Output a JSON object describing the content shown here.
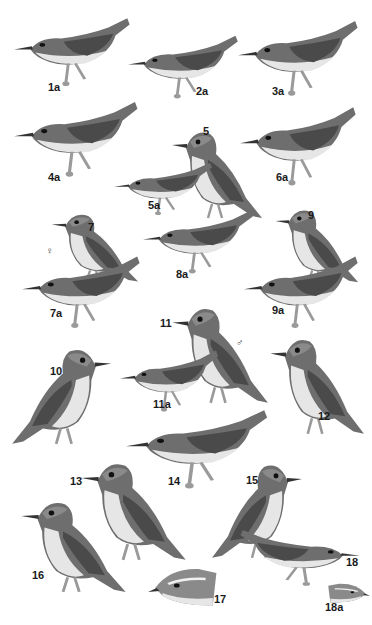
{
  "plate": {
    "background": "#ffffff",
    "colors": {
      "back": "#6e6e6e",
      "wing": "#4a4a4a",
      "belly": "#e6e6e6",
      "head": "#8a8a8a",
      "leg": "#9a9a9a",
      "label": "#1a1a1a"
    },
    "birds": [
      {
        "label": "1a",
        "x": 14,
        "y": 12,
        "w": 118,
        "h": 78,
        "facing": "left",
        "pose": "horizontal",
        "lx": 48,
        "ly": 82
      },
      {
        "label": "2a",
        "x": 128,
        "y": 30,
        "w": 112,
        "h": 72,
        "facing": "left",
        "pose": "horizontal",
        "lx": 196,
        "ly": 86
      },
      {
        "label": "3a",
        "x": 238,
        "y": 14,
        "w": 122,
        "h": 86,
        "facing": "left",
        "pose": "horizontal",
        "lx": 272,
        "ly": 86
      },
      {
        "label": "4a",
        "x": 14,
        "y": 95,
        "w": 126,
        "h": 86,
        "facing": "left",
        "pose": "horizontal",
        "lx": 48,
        "ly": 172
      },
      {
        "label": "5",
        "x": 164,
        "y": 120,
        "w": 100,
        "h": 100,
        "facing": "left",
        "pose": "upright",
        "lx": 203,
        "ly": 126
      },
      {
        "label": "5a",
        "x": 114,
        "y": 158,
        "w": 100,
        "h": 60,
        "facing": "left",
        "pose": "horizontal",
        "lx": 148,
        "ly": 200
      },
      {
        "label": "6a",
        "x": 240,
        "y": 100,
        "w": 118,
        "h": 90,
        "facing": "left",
        "pose": "horizontal",
        "lx": 276,
        "ly": 172
      },
      {
        "label": "7",
        "x": 44,
        "y": 205,
        "w": 96,
        "h": 78,
        "facing": "left",
        "pose": "upright",
        "lx": 88,
        "ly": 222
      },
      {
        "label": "7a",
        "x": 22,
        "y": 250,
        "w": 120,
        "h": 82,
        "facing": "left",
        "pose": "horizontal",
        "lx": 50,
        "ly": 308
      },
      {
        "label": "8a",
        "x": 143,
        "y": 205,
        "w": 112,
        "h": 72,
        "facing": "left",
        "pose": "horizontal",
        "lx": 176,
        "ly": 269
      },
      {
        "label": "9",
        "x": 268,
        "y": 200,
        "w": 92,
        "h": 84,
        "facing": "left",
        "pose": "upright",
        "lx": 308,
        "ly": 210
      },
      {
        "label": "9a",
        "x": 244,
        "y": 250,
        "w": 116,
        "h": 82,
        "facing": "left",
        "pose": "horizontal",
        "lx": 272,
        "ly": 305
      },
      {
        "label": "11",
        "x": 164,
        "y": 295,
        "w": 106,
        "h": 110,
        "facing": "left",
        "pose": "upright",
        "lx": 160,
        "ly": 318
      },
      {
        "label": "11a",
        "x": 120,
        "y": 345,
        "w": 100,
        "h": 70,
        "facing": "left",
        "pose": "horizontal",
        "lx": 153,
        "ly": 399
      },
      {
        "label": "10",
        "x": 10,
        "y": 336,
        "w": 110,
        "h": 110,
        "facing": "right",
        "pose": "upright",
        "lx": 50,
        "ly": 366
      },
      {
        "label": "12",
        "x": 262,
        "y": 326,
        "w": 104,
        "h": 110,
        "facing": "left",
        "pose": "upright",
        "lx": 318,
        "ly": 411
      },
      {
        "label": "14",
        "x": 126,
        "y": 403,
        "w": 144,
        "h": 90,
        "facing": "left",
        "pose": "horizontal",
        "lx": 168,
        "ly": 476
      },
      {
        "label": "13",
        "x": 72,
        "y": 450,
        "w": 116,
        "h": 112,
        "facing": "left",
        "pose": "upright",
        "lx": 70,
        "ly": 476
      },
      {
        "label": "15",
        "x": 210,
        "y": 452,
        "w": 100,
        "h": 108,
        "facing": "right",
        "pose": "upright",
        "lx": 246,
        "ly": 475
      },
      {
        "label": "16",
        "x": 12,
        "y": 490,
        "w": 116,
        "h": 104,
        "facing": "left",
        "pose": "upright",
        "lx": 32,
        "ly": 570
      },
      {
        "label": "17",
        "x": 148,
        "y": 558,
        "w": 72,
        "h": 50,
        "facing": "left",
        "pose": "head",
        "lx": 214,
        "ly": 594
      },
      {
        "label": "18",
        "x": 238,
        "y": 525,
        "w": 122,
        "h": 64,
        "facing": "right",
        "pose": "horizontal",
        "lx": 346,
        "ly": 557
      },
      {
        "label": "18a",
        "x": 326,
        "y": 578,
        "w": 44,
        "h": 26,
        "facing": "right",
        "pose": "head",
        "lx": 325,
        "ly": 602
      }
    ],
    "sex_symbols": [
      {
        "symbol": "♀",
        "x": 46,
        "y": 246
      },
      {
        "symbol": "♂",
        "x": 236,
        "y": 338
      }
    ]
  }
}
